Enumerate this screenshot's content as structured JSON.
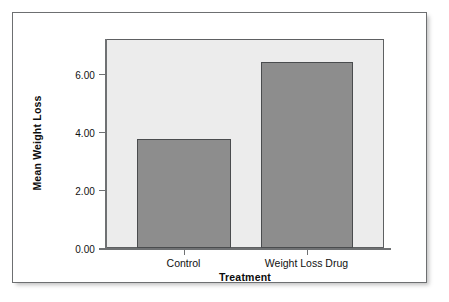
{
  "chart_data": {
    "type": "bar",
    "title": "",
    "subtitle": "",
    "xlabel": "Treatment",
    "ylabel": "Mean Weight Loss",
    "categories": [
      "Control",
      "Weight Loss Drug"
    ],
    "values": [
      3.75,
      6.4
    ],
    "series": [
      {
        "name": "Mean Weight Loss",
        "values": [
          3.75,
          6.4
        ]
      }
    ],
    "ylim": [
      0.0,
      7.2
    ],
    "yticks": [
      "0.00",
      "2.00",
      "4.00",
      "6.00"
    ],
    "ytick_values": [
      0.0,
      2.0,
      4.0,
      6.0
    ],
    "xtick_labels": [
      "Control",
      "Weight Loss Drug"
    ],
    "grid": false,
    "legend": false,
    "legend_position": "none",
    "annotations": [],
    "colors": {
      "bar_fill": "#8d8d8d",
      "bar_edge": "#4a4c4e",
      "plot_background": "#ececec",
      "figure_background": "#ffffff",
      "axis_line": "#6f7173",
      "frame_border": "#6d6f71",
      "text": "#111111"
    }
  },
  "figure": {
    "frame_label": "chart-frame",
    "plot_label": "plot-area"
  }
}
